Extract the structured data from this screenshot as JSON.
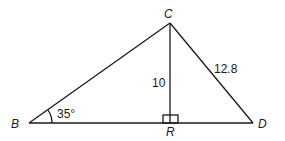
{
  "diagram": {
    "type": "triangle",
    "vertices": {
      "B": {
        "label": "B"
      },
      "C": {
        "label": "C"
      },
      "D": {
        "label": "D"
      },
      "R": {
        "label": "R"
      }
    },
    "segments": [
      {
        "from": "B",
        "to": "C"
      },
      {
        "from": "C",
        "to": "D"
      },
      {
        "from": "B",
        "to": "D"
      },
      {
        "from": "C",
        "to": "R",
        "length_label": "10"
      },
      {
        "from": "C",
        "to": "D",
        "length_label": "12.8"
      }
    ],
    "angle_B_label": "35°",
    "right_angle_at": "R",
    "line_color": "#1a1a1a"
  }
}
